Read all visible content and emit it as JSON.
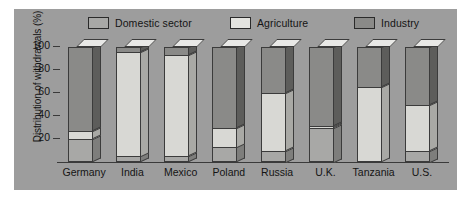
{
  "chart_data": {
    "type": "bar",
    "subtype": "100% stacked bar (3D)",
    "title": "",
    "xlabel": "",
    "ylabel": "Distribution of withdrawals (%)",
    "ylim": [
      0,
      100
    ],
    "yticks": [
      20,
      40,
      60,
      80,
      100
    ],
    "grid": false,
    "legend_position": "top",
    "categories": [
      "Germany",
      "India",
      "Mexico",
      "Poland",
      "Russia",
      "U.K.",
      "Tanzania",
      "U.S."
    ],
    "series": [
      {
        "name": "Domestic sector",
        "color": "#a8a8a6",
        "values": [
          20,
          5,
          5,
          13,
          10,
          30,
          0,
          10
        ]
      },
      {
        "name": "Agriculture",
        "color": "#d8d8d4",
        "values": [
          7,
          91,
          88,
          17,
          50,
          1,
          65,
          40
        ]
      },
      {
        "name": "Industry",
        "color": "#8a8a88",
        "values": [
          73,
          4,
          7,
          70,
          40,
          69,
          35,
          50
        ]
      }
    ]
  },
  "legend": {
    "items": [
      {
        "label": "Domestic sector",
        "swatch_color": "#a8a8a6"
      },
      {
        "label": "Agriculture",
        "swatch_color": "#e4e4e0"
      },
      {
        "label": "Industry",
        "swatch_color": "#8a8a88"
      }
    ]
  },
  "axis": {
    "y_title": "Distribution of withdrawals (%)",
    "y_tick_labels": [
      "100",
      "80",
      "60",
      "40",
      "20"
    ],
    "x_tick_labels": [
      "Germany",
      "India",
      "Mexico",
      "Poland",
      "Russia",
      "U.K.",
      "Tanzania",
      "U.S."
    ]
  },
  "colors": {
    "panel_background": "#9d9d9d",
    "page_background": "#ffffff",
    "axis_line": "#3a3a3a",
    "text": "#141414",
    "segment_outline": "#3b3b3b",
    "top_face": "#e8e8e6"
  }
}
